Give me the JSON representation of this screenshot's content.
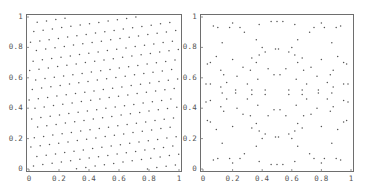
{
  "chart_data": [
    {
      "type": "scatter",
      "title": "",
      "xlabel": "",
      "ylabel": "",
      "xlim": [
        0,
        1
      ],
      "ylim": [
        0,
        1
      ],
      "grid": false,
      "legend": null,
      "x_ticks": [
        "0",
        "0.2",
        "0.4",
        "0.6",
        "0.8",
        "1"
      ],
      "y_ticks": [
        "0",
        "0.2",
        "0.4",
        "0.6",
        "0.8",
        "1"
      ],
      "description": "Near-uniform slightly rotated lattice of ~256 points filling the unit square",
      "lattice": {
        "n": 16,
        "spacing": 0.0625,
        "angle_deg": 8,
        "offset_x": 0.03,
        "offset_y": 0.02
      }
    },
    {
      "type": "scatter",
      "title": "",
      "xlabel": "",
      "ylabel": "",
      "xlim": [
        0,
        1
      ],
      "ylim": [
        0,
        1
      ],
      "grid": false,
      "legend": null,
      "x_ticks": [
        "0",
        "0.2",
        "0.4",
        "0.6",
        "0.8",
        "1"
      ],
      "y_ticks": [
        "0",
        "0.2",
        "0.4",
        "0.6",
        "0.8",
        "1"
      ],
      "description": "Symmetric point pattern arranged along concentric rings centered at (0.5,0.5)",
      "points": [
        [
          0.5,
          0.97
        ],
        [
          0.46,
          0.97
        ],
        [
          0.54,
          0.97
        ],
        [
          0.2,
          0.96
        ],
        [
          0.07,
          0.94
        ],
        [
          0.1,
          0.93
        ],
        [
          0.93,
          0.94
        ],
        [
          0.9,
          0.93
        ],
        [
          0.8,
          0.96
        ],
        [
          0.38,
          0.95
        ],
        [
          0.62,
          0.95
        ],
        [
          0.25,
          0.93
        ],
        [
          0.75,
          0.93
        ],
        [
          0.28,
          0.9
        ],
        [
          0.72,
          0.9
        ],
        [
          0.18,
          0.93
        ],
        [
          0.82,
          0.93
        ],
        [
          0.36,
          0.85
        ],
        [
          0.64,
          0.85
        ],
        [
          0.13,
          0.83
        ],
        [
          0.87,
          0.83
        ],
        [
          0.4,
          0.8
        ],
        [
          0.6,
          0.8
        ],
        [
          0.49,
          0.79
        ],
        [
          0.51,
          0.79
        ],
        [
          0.42,
          0.77
        ],
        [
          0.58,
          0.77
        ],
        [
          0.38,
          0.75
        ],
        [
          0.62,
          0.75
        ],
        [
          0.09,
          0.74
        ],
        [
          0.91,
          0.74
        ],
        [
          0.33,
          0.73
        ],
        [
          0.67,
          0.73
        ],
        [
          0.2,
          0.72
        ],
        [
          0.8,
          0.72
        ],
        [
          0.05,
          0.7
        ],
        [
          0.95,
          0.7
        ],
        [
          0.03,
          0.69
        ],
        [
          0.97,
          0.69
        ],
        [
          0.36,
          0.7
        ],
        [
          0.64,
          0.7
        ],
        [
          0.27,
          0.67
        ],
        [
          0.73,
          0.67
        ],
        [
          0.44,
          0.66
        ],
        [
          0.56,
          0.66
        ],
        [
          0.12,
          0.65
        ],
        [
          0.88,
          0.65
        ],
        [
          0.32,
          0.65
        ],
        [
          0.68,
          0.65
        ],
        [
          0.48,
          0.62
        ],
        [
          0.52,
          0.62
        ],
        [
          0.14,
          0.62
        ],
        [
          0.86,
          0.62
        ],
        [
          0.23,
          0.61
        ],
        [
          0.77,
          0.61
        ],
        [
          0.37,
          0.59
        ],
        [
          0.63,
          0.59
        ],
        [
          0.02,
          0.56
        ],
        [
          0.98,
          0.56
        ],
        [
          0.05,
          0.56
        ],
        [
          0.95,
          0.56
        ],
        [
          0.16,
          0.57
        ],
        [
          0.84,
          0.57
        ],
        [
          0.3,
          0.56
        ],
        [
          0.7,
          0.56
        ],
        [
          0.12,
          0.54
        ],
        [
          0.88,
          0.54
        ],
        [
          0.22,
          0.52
        ],
        [
          0.78,
          0.52
        ],
        [
          0.33,
          0.52
        ],
        [
          0.67,
          0.52
        ],
        [
          0.42,
          0.52
        ],
        [
          0.58,
          0.52
        ],
        [
          0.13,
          0.5
        ],
        [
          0.87,
          0.5
        ],
        [
          0.22,
          0.5
        ],
        [
          0.78,
          0.5
        ],
        [
          0.33,
          0.49
        ],
        [
          0.67,
          0.49
        ],
        [
          0.42,
          0.49
        ],
        [
          0.58,
          0.49
        ],
        [
          0.16,
          0.46
        ],
        [
          0.84,
          0.46
        ],
        [
          0.3,
          0.46
        ],
        [
          0.7,
          0.46
        ],
        [
          0.05,
          0.45
        ],
        [
          0.95,
          0.45
        ],
        [
          0.02,
          0.44
        ],
        [
          0.98,
          0.44
        ],
        [
          0.12,
          0.41
        ],
        [
          0.88,
          0.41
        ],
        [
          0.23,
          0.4
        ],
        [
          0.77,
          0.4
        ],
        [
          0.37,
          0.42
        ],
        [
          0.63,
          0.42
        ],
        [
          0.48,
          0.39
        ],
        [
          0.52,
          0.39
        ],
        [
          0.14,
          0.38
        ],
        [
          0.86,
          0.38
        ],
        [
          0.27,
          0.36
        ],
        [
          0.73,
          0.36
        ],
        [
          0.32,
          0.35
        ],
        [
          0.68,
          0.35
        ],
        [
          0.44,
          0.35
        ],
        [
          0.56,
          0.35
        ],
        [
          0.36,
          0.3
        ],
        [
          0.64,
          0.3
        ],
        [
          0.05,
          0.31
        ],
        [
          0.95,
          0.31
        ],
        [
          0.03,
          0.32
        ],
        [
          0.97,
          0.32
        ],
        [
          0.2,
          0.28
        ],
        [
          0.8,
          0.28
        ],
        [
          0.09,
          0.26
        ],
        [
          0.91,
          0.26
        ],
        [
          0.33,
          0.27
        ],
        [
          0.67,
          0.27
        ],
        [
          0.38,
          0.25
        ],
        [
          0.62,
          0.25
        ],
        [
          0.42,
          0.23
        ],
        [
          0.58,
          0.23
        ],
        [
          0.4,
          0.2
        ],
        [
          0.6,
          0.2
        ],
        [
          0.49,
          0.21
        ],
        [
          0.51,
          0.21
        ],
        [
          0.13,
          0.17
        ],
        [
          0.87,
          0.17
        ],
        [
          0.36,
          0.15
        ],
        [
          0.64,
          0.15
        ],
        [
          0.28,
          0.1
        ],
        [
          0.72,
          0.1
        ],
        [
          0.18,
          0.07
        ],
        [
          0.82,
          0.07
        ],
        [
          0.25,
          0.07
        ],
        [
          0.75,
          0.07
        ],
        [
          0.38,
          0.05
        ],
        [
          0.62,
          0.05
        ],
        [
          0.07,
          0.06
        ],
        [
          0.1,
          0.07
        ],
        [
          0.93,
          0.06
        ],
        [
          0.9,
          0.07
        ],
        [
          0.2,
          0.04
        ],
        [
          0.8,
          0.04
        ],
        [
          0.5,
          0.03
        ],
        [
          0.46,
          0.03
        ],
        [
          0.54,
          0.03
        ]
      ]
    }
  ]
}
